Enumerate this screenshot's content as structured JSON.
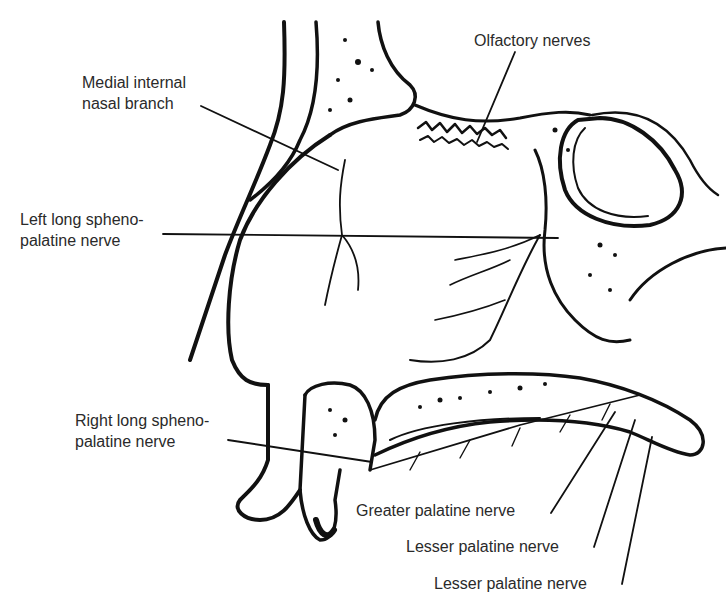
{
  "figure": {
    "colors": {
      "ink": "#111111",
      "label": "#2a2a2a",
      "background": "#ffffff"
    }
  },
  "labels": [
    {
      "id": "olfactory",
      "lines": [
        "Olfactory nerves"
      ]
    },
    {
      "id": "medial-internal",
      "lines": [
        "Medial internal",
        "nasal branch"
      ]
    },
    {
      "id": "left-long",
      "lines": [
        "Left long spheno-",
        "palatine nerve"
      ]
    },
    {
      "id": "right-long",
      "lines": [
        "Right long spheno-",
        "palatine nerve"
      ]
    },
    {
      "id": "greater-palatine",
      "lines": [
        "Greater palatine nerve"
      ]
    },
    {
      "id": "lesser-palatine-1",
      "lines": [
        "Lesser palatine nerve"
      ]
    },
    {
      "id": "lesser-palatine-2",
      "lines": [
        "Lesser palatine nerve"
      ]
    }
  ]
}
